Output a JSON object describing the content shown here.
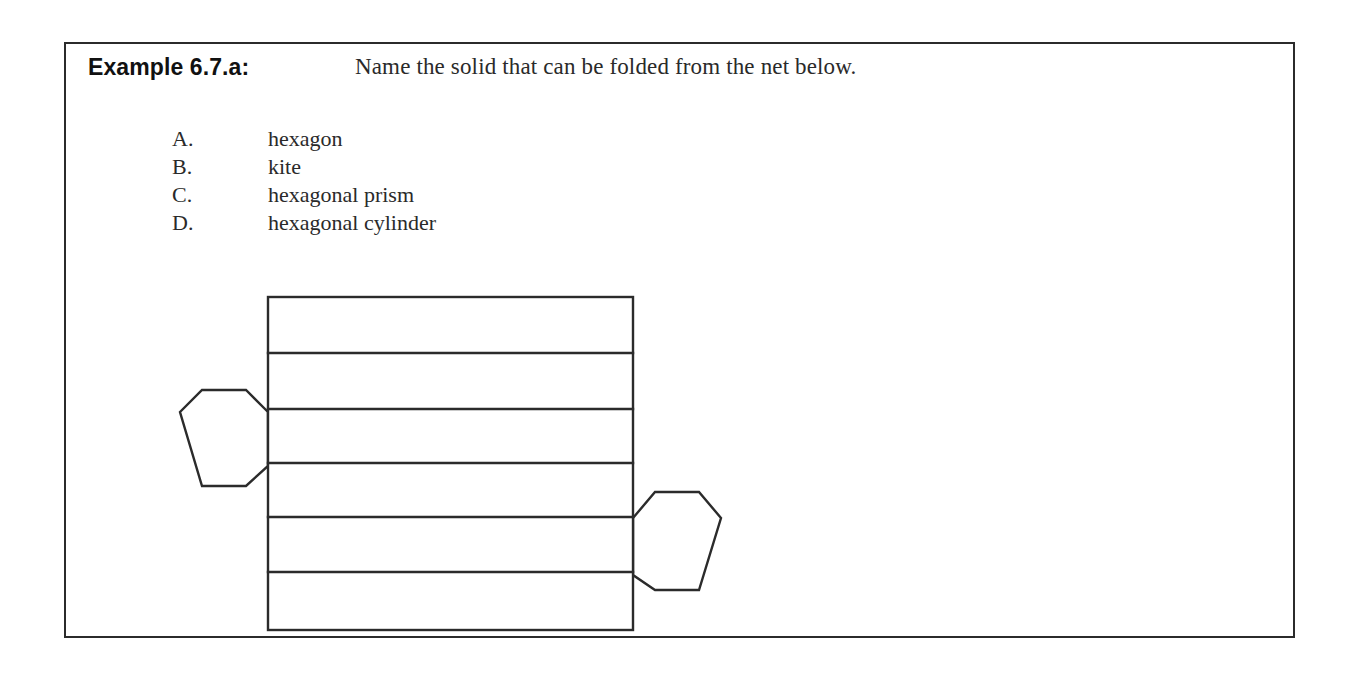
{
  "page": {
    "background_color": "#ffffff",
    "border_color": "#2b2b2b",
    "ink_color": "#2a2a2a"
  },
  "header": {
    "example_label": "Example 6.7.a:",
    "prompt": "Name the solid that can be folded from the net below."
  },
  "choices": [
    {
      "letter": "A.",
      "text": "hexagon"
    },
    {
      "letter": "B.",
      "text": "kite"
    },
    {
      "letter": "C.",
      "text": "hexagonal prism"
    },
    {
      "letter": "D.",
      "text": "hexagonal cylinder"
    }
  ],
  "figure": {
    "caption": "net of a hexagonal prism",
    "stroke_color": "#2b2b2b",
    "fill_color": "#ffffff",
    "band_count": 6,
    "hexagon_count": 2,
    "rect": {
      "x": 98,
      "y": 15,
      "width": 365,
      "height": 333
    },
    "band_dividers": [
      71,
      127,
      181,
      235,
      290
    ],
    "left_hexagon": {
      "position": "left edge of rectangle",
      "points": "98,130 75,108 10,108 -12,130 10,204 75,204 98,184"
    },
    "right_hexagon": {
      "position": "right edge of rectangle",
      "points": "463,236 486,210 551,210 573,236 551,308 486,308 463,293"
    }
  }
}
